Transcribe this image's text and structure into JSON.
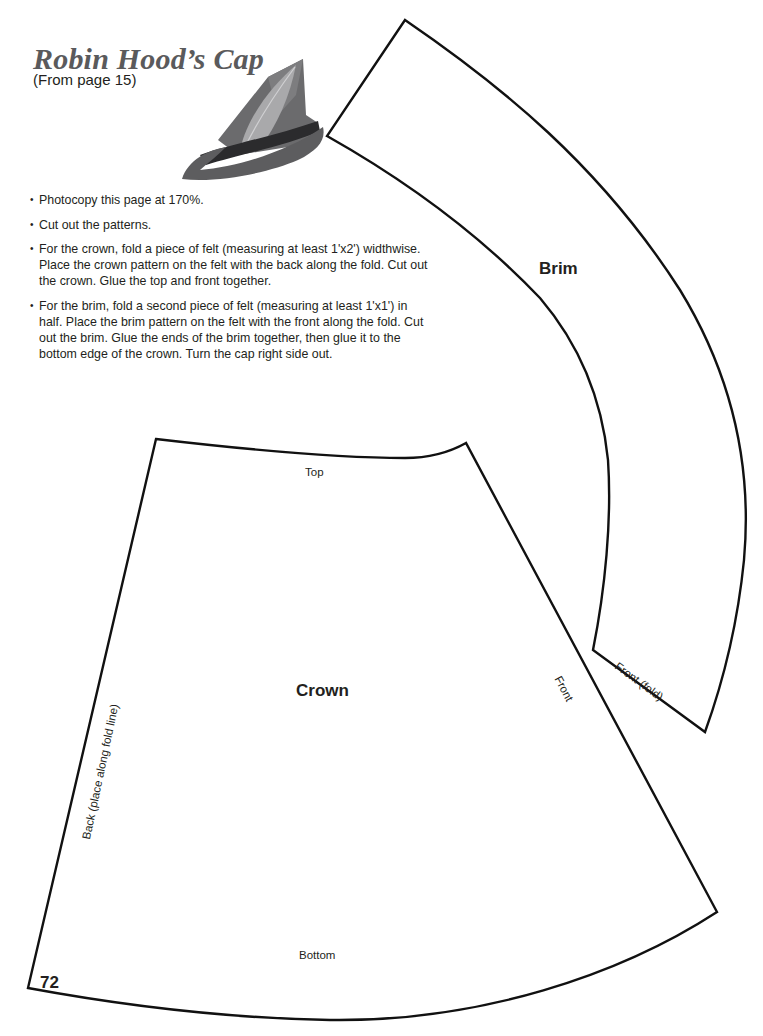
{
  "header": {
    "title": "Robin Hood’s Cap",
    "subtitle": "(From page 15)"
  },
  "image": {
    "subject": "robin-hood-cap-photo",
    "colors": {
      "felt": "#6e6e6e",
      "band": "#2a2a2a",
      "feather": "#a8a8a8"
    }
  },
  "instructions": [
    "Photocopy this page at 170%.",
    "Cut out the patterns.",
    "For the crown, fold a piece of felt (measuring at least 1'x2') widthwise. Place the crown pattern on the felt with the back along the fold. Cut out the crown. Glue the top and front together.",
    "For the brim, fold a second piece of felt (measuring at least 1'x1') in half. Place the brim pattern on the felt with the front along the fold. Cut out the brim. Glue the ends of the brim together, then glue it to the bottom edge of the crown. Turn the cap right side out."
  ],
  "patterns": {
    "brim": {
      "name": "Brim",
      "labels": {
        "fold_edge": "Front (fold)"
      }
    },
    "crown": {
      "name": "Crown",
      "labels": {
        "top": "Top",
        "bottom": "Bottom",
        "front": "Front",
        "back": "Back (place along fold line)"
      }
    }
  },
  "footer": {
    "page_number": "72"
  }
}
